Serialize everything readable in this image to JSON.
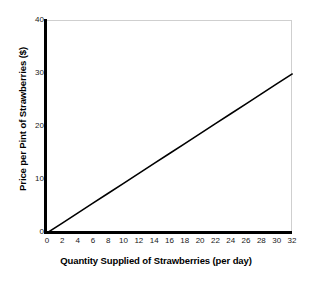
{
  "chart_data": {
    "type": "line",
    "title": "",
    "subtitle": "",
    "xlabel": "Quantity Supplied of Strawberries (per day)",
    "ylabel": "Price per Pint of Strawberries ($)",
    "xlim": [
      0,
      32
    ],
    "ylim": [
      0,
      40
    ],
    "xticks": [
      0,
      2,
      4,
      6,
      8,
      10,
      12,
      14,
      16,
      18,
      20,
      22,
      24,
      26,
      28,
      30,
      32
    ],
    "xtick_labels": [
      "0",
      "2",
      "4",
      "6",
      "8",
      "10",
      "12",
      "14",
      "16",
      "18",
      "20",
      "22",
      "24",
      "26",
      "28",
      "30",
      "32"
    ],
    "yticks": [
      0,
      10,
      20,
      30,
      40
    ],
    "ytick_labels": [
      "0",
      "10",
      "20",
      "30",
      "40"
    ],
    "grid": false,
    "legend": null,
    "legend_position": "none",
    "annotations": [],
    "series": [
      {
        "name": "Supply",
        "type": "line",
        "color": "#000000",
        "linewidth": 1.6,
        "x": [
          0,
          2,
          4,
          6,
          8,
          10,
          12,
          14,
          16,
          18,
          20,
          22,
          24,
          26,
          28,
          30,
          32
        ],
        "values": [
          0,
          1.875,
          3.75,
          5.625,
          7.5,
          9.375,
          11.25,
          13.125,
          15,
          16.875,
          18.75,
          20.625,
          22.5,
          24.375,
          26.25,
          28.125,
          30
        ],
        "endpoints": [
          [
            0,
            0
          ],
          [
            32,
            30
          ]
        ],
        "slope": 0.9375
      }
    ]
  },
  "figure": {
    "background_color": "#ffffff",
    "axis_color": "#000000",
    "frame_color": "#cfcfcf"
  }
}
